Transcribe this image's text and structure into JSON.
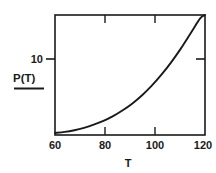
{
  "chart_data": {
    "type": "line",
    "title": "",
    "xlabel": "T",
    "ylabel": "P(T)",
    "ylabel_display": "P(T)",
    "xlim": [
      60,
      122
    ],
    "ylim": [
      0,
      17.5
    ],
    "grid": false,
    "legend": null,
    "x_ticks": [
      {
        "value": 60,
        "label": "60"
      },
      {
        "value": 80,
        "label": "80"
      },
      {
        "value": 100,
        "label": "100"
      },
      {
        "value": 120,
        "label": "120"
      }
    ],
    "y_ticks": [
      {
        "value": 10,
        "label": "10"
      }
    ],
    "series": [
      {
        "name": "P(T)",
        "color": "#1a1a1a",
        "x": [
          60,
          64,
          68,
          72,
          76,
          80,
          84,
          88,
          92,
          96,
          100,
          104,
          108,
          112,
          116,
          120,
          122
        ],
        "values": [
          0.3,
          0.45,
          0.7,
          1.05,
          1.5,
          2.05,
          2.75,
          3.6,
          4.6,
          5.8,
          7.2,
          8.8,
          10.6,
          12.6,
          14.8,
          17.0,
          17.5
        ]
      }
    ],
    "axis_frame": true,
    "ticks_inward": true,
    "ticks_on_all_sides": true
  },
  "axis_labels": {
    "x_axis_name": "T",
    "y_axis_name": "P(T)"
  }
}
